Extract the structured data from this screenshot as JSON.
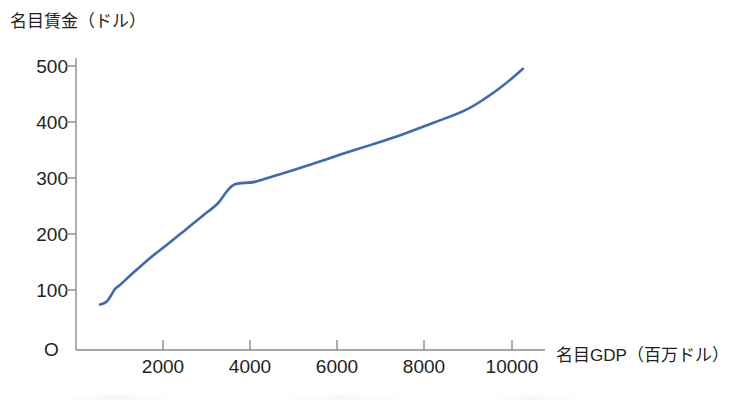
{
  "chart_data": {
    "type": "line",
    "title": "",
    "subtitle": "",
    "xlabel": "名目GDP（百万ドル）",
    "ylabel": "名目賃金（ドル）",
    "origin_label": "O",
    "xlim": [
      0,
      10800
    ],
    "ylim": [
      0,
      540
    ],
    "xticks": [
      2000,
      4000,
      6000,
      8000,
      10000
    ],
    "xtick_labels": [
      "2000",
      "4000",
      "6000",
      "8000",
      "10000"
    ],
    "yticks": [
      100,
      200,
      300,
      400,
      500
    ],
    "ytick_labels": [
      "100",
      "200",
      "300",
      "400",
      "500"
    ],
    "grid": false,
    "legend": false,
    "legend_position": "none",
    "series": [
      {
        "name": "名目賃金",
        "color": "#4069b0",
        "x": [
          550,
          700,
          820,
          900,
          1000,
          1300,
          1700,
          2100,
          2500,
          2900,
          3250,
          3600,
          4100,
          4700,
          5400,
          6100,
          6800,
          7500,
          8200,
          9000,
          9700,
          10250
        ],
        "y": [
          80,
          85,
          98,
          108,
          114,
          135,
          162,
          186,
          211,
          236,
          258,
          290,
          296,
          310,
          327,
          345,
          362,
          380,
          400,
          425,
          460,
          495
        ]
      }
    ]
  },
  "axes": {
    "y_axis_name": "y-axis",
    "x_axis_name": "x-axis"
  }
}
